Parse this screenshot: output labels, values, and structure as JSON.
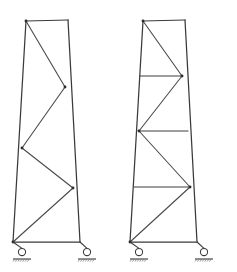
{
  "figure": {
    "background_color": "#ffffff",
    "line_color": "#3a3a3a",
    "joint_color": "#2b2b2b",
    "canvas": {
      "width": 237,
      "height": 272
    }
  },
  "structures": [
    {
      "id": "left-truss",
      "name": "Left tapered truss tower",
      "bracing_type": "zigzag-diagonal-only",
      "has_horizontal_members": false,
      "panel_count": 4,
      "geometry": {
        "top_left": [
          26,
          21
        ],
        "top_right": [
          68,
          20
        ],
        "bottom_left": [
          13,
          242
        ],
        "bottom_right": [
          80,
          242
        ],
        "top_chord": [
          [
            26,
            21
          ],
          [
            68,
            20
          ]
        ],
        "bottom_chord": [
          [
            13,
            242
          ],
          [
            80,
            242
          ]
        ],
        "left_chord": [
          [
            26,
            21
          ],
          [
            13,
            242
          ]
        ],
        "right_chord": [
          [
            68,
            20
          ],
          [
            80,
            242
          ]
        ],
        "diagonal_path": [
          [
            26,
            21
          ],
          [
            65,
            87
          ],
          [
            22,
            148
          ],
          [
            73,
            188
          ],
          [
            13,
            242
          ]
        ],
        "joints": [
          [
            26,
            21
          ],
          [
            65,
            87
          ],
          [
            22,
            148
          ],
          [
            73,
            188
          ],
          [
            13,
            242
          ]
        ],
        "horizontal_members": []
      },
      "supports": [
        {
          "name": "roller-support-left",
          "type": "roller",
          "node": [
            13,
            242
          ],
          "circle_center": [
            22,
            252
          ],
          "circle_radius": 3.6,
          "ground_y": 259,
          "ground_half_width": 9
        },
        {
          "name": "roller-support-right",
          "type": "roller",
          "node": [
            80,
            242
          ],
          "circle_center": [
            87,
            252
          ],
          "circle_radius": 3.6,
          "ground_y": 259,
          "ground_half_width": 9
        }
      ]
    },
    {
      "id": "right-truss",
      "name": "Right tapered truss tower with horizontal ties",
      "bracing_type": "zigzag-diagonal-with-horizontals",
      "has_horizontal_members": true,
      "panel_count": 4,
      "geometry": {
        "top_left": [
          143,
          21
        ],
        "top_right": [
          185,
          20
        ],
        "bottom_left": [
          130,
          242
        ],
        "bottom_right": [
          197,
          242
        ],
        "top_chord": [
          [
            143,
            21
          ],
          [
            185,
            20
          ]
        ],
        "bottom_chord": [
          [
            130,
            242
          ],
          [
            197,
            242
          ]
        ],
        "left_chord": [
          [
            143,
            21
          ],
          [
            130,
            242
          ]
        ],
        "right_chord": [
          [
            185,
            20
          ],
          [
            197,
            242
          ]
        ],
        "diagonal_path": [
          [
            143,
            21
          ],
          [
            182,
            76
          ],
          [
            139,
            131
          ],
          [
            190,
            187
          ],
          [
            130,
            242
          ]
        ],
        "joints": [
          [
            143,
            21
          ],
          [
            182,
            76
          ],
          [
            139,
            131
          ],
          [
            190,
            187
          ],
          [
            130,
            242
          ]
        ],
        "horizontal_members": [
          {
            "name": "horizontal-tie-1",
            "from": [
              140,
              76
            ],
            "to": [
              182,
              76
            ],
            "level": 1
          },
          {
            "name": "horizontal-tie-2",
            "from": [
              139,
              131
            ],
            "to": [
              188,
              131
            ],
            "level": 2
          },
          {
            "name": "horizontal-tie-3",
            "from": [
              134,
              187
            ],
            "to": [
              190,
              187
            ],
            "level": 3
          }
        ]
      },
      "supports": [
        {
          "name": "roller-support-left",
          "type": "roller",
          "node": [
            130,
            242
          ],
          "circle_center": [
            139,
            252
          ],
          "circle_radius": 3.6,
          "ground_y": 259,
          "ground_half_width": 9
        },
        {
          "name": "roller-support-right",
          "type": "roller",
          "node": [
            197,
            242
          ],
          "circle_center": [
            204,
            252
          ],
          "circle_radius": 3.6,
          "ground_y": 259,
          "ground_half_width": 9
        }
      ]
    }
  ]
}
